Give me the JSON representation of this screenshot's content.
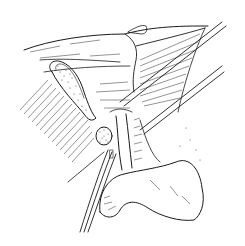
{
  "figure": {
    "type": "surgical-anatomy-line-illustration",
    "background": "#ffffff",
    "ink_color": "#1a1a1a",
    "width": 245,
    "height": 246,
    "elements": [
      {
        "name": "liver",
        "description": "Retracted liver lobe with hatched shading across upper area"
      },
      {
        "name": "gallbladder",
        "description": "Stippled elongated sac on left side"
      },
      {
        "name": "common-bile-duct",
        "description": "Vertical tubular duct in center"
      },
      {
        "name": "stone",
        "description": "Stippled round mass near the duct"
      },
      {
        "name": "duodenum-stomach",
        "description": "Large lobulated organ lower right"
      },
      {
        "name": "retractor-upper",
        "description": "Long straight instrument lines at upper right"
      },
      {
        "name": "retractor-middle",
        "description": "Parallel instrument lines crossing center-right"
      },
      {
        "name": "drain-tubes",
        "description": "Parallel tubes running down to lower left"
      }
    ]
  }
}
